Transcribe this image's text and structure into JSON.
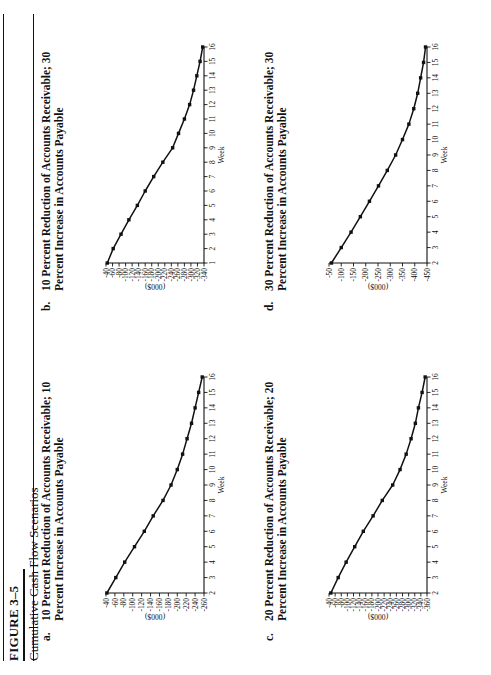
{
  "figure": {
    "number": "FIGURE 3–5",
    "title": "Cumulative Cash Flow Scenarios"
  },
  "axis_names": {
    "x": "Week",
    "y_units": "(000$)"
  },
  "panels": [
    {
      "letter": "a.",
      "title": "10 Percent Reduction of Accounts Receivable; 10 Percent Increase in Accounts Payable"
    },
    {
      "letter": "b.",
      "title": "10 Percent Reduction of Accounts Receivable; 30 Percent Increase in Accounts Payable"
    },
    {
      "letter": "c.",
      "title": "20 Percent Reduction of Accounts Receivable; 20 Percent Increase in Accounts Payable"
    },
    {
      "letter": "d.",
      "title": "30 Percent Reduction of Accounts Receivable; 30 Percent Increase in Accounts Payable"
    }
  ],
  "chart_data": [
    {
      "type": "line",
      "title": "10 Percent Reduction of Accounts Receivable; 10 Percent Increase in Accounts Payable",
      "panel": "a",
      "xlabel": "Week",
      "ylabel": "(000$)",
      "x": [
        2,
        3,
        4,
        5,
        6,
        7,
        8,
        9,
        10,
        11,
        12,
        13,
        14,
        15,
        16
      ],
      "xticklabels": [
        "2",
        "3",
        "4",
        "5",
        "6",
        "7",
        "8",
        "9",
        "10",
        "11",
        "12",
        "13",
        "14",
        "15",
        "16"
      ],
      "xlim": [
        2,
        16
      ],
      "yticklabels": [
        "-40",
        "-60",
        "-80",
        "-100",
        "-120",
        "-140",
        "-160",
        "-180",
        "-200",
        "-220",
        "-240",
        "-260"
      ],
      "ylim": [
        -260,
        -40
      ],
      "grid": false,
      "legend": "none",
      "markers": true,
      "series": [
        {
          "name": "Cumulative cash flow",
          "values": [
            -42,
            -62,
            -82,
            -104,
            -126,
            -146,
            -168,
            -186,
            -200,
            -212,
            -222,
            -232,
            -240,
            -248,
            -256
          ]
        }
      ]
    },
    {
      "type": "line",
      "title": "10 Percent Reduction of Accounts Receivable; 30 Percent Increase in Accounts Payable",
      "panel": "b",
      "xlabel": "Week",
      "ylabel": "(000$)",
      "x": [
        1,
        2,
        3,
        4,
        5,
        6,
        7,
        8,
        9,
        10,
        11,
        12,
        13,
        14,
        15,
        16
      ],
      "xticklabels": [
        "1",
        "2",
        "3",
        "4",
        "5",
        "6",
        "7",
        "8",
        "9",
        "10",
        "11",
        "12",
        "13",
        "14",
        "15",
        "16"
      ],
      "xlim": [
        1,
        16
      ],
      "yticklabels": [
        "-40",
        "-60",
        "-80",
        "-100",
        "-120",
        "-140",
        "-160",
        "-180",
        "-200",
        "-220",
        "-240",
        "-260",
        "-280",
        "-300",
        "-320",
        "-340"
      ],
      "ylim": [
        -340,
        -40
      ],
      "grid": false,
      "legend": "none",
      "markers": true,
      "series": [
        {
          "name": "Cumulative cash flow",
          "values": [
            -44,
            -62,
            -86,
            -110,
            -136,
            -160,
            -186,
            -214,
            -244,
            -262,
            -280,
            -296,
            -308,
            -318,
            -328,
            -336
          ]
        }
      ]
    },
    {
      "type": "line",
      "title": "20 Percent Reduction of Accounts Receivable; 20 Percent Increase in Accounts Payable",
      "panel": "c",
      "xlabel": "Week",
      "ylabel": "(000$)",
      "x": [
        2,
        3,
        4,
        5,
        6,
        7,
        8,
        9,
        10,
        11,
        12,
        13,
        14,
        15,
        16
      ],
      "xticklabels": [
        "2",
        "3",
        "4",
        "5",
        "6",
        "7",
        "8",
        "9",
        "10",
        "11",
        "12",
        "13",
        "14",
        "15",
        "16"
      ],
      "xlim": [
        2,
        16
      ],
      "yticklabels": [
        "-40",
        "-60",
        "-80",
        "-100",
        "-120",
        "-140",
        "-160",
        "-180",
        "-200",
        "-220",
        "-240",
        "-260",
        "-280",
        "-300",
        "-320",
        "-340",
        "-360"
      ],
      "ylim": [
        -360,
        -40
      ],
      "grid": false,
      "legend": "none",
      "markers": true,
      "series": [
        {
          "name": "Cumulative cash flow",
          "values": [
            -46,
            -70,
            -96,
            -124,
            -152,
            -184,
            -214,
            -248,
            -272,
            -292,
            -308,
            -322,
            -332,
            -344,
            -354
          ]
        }
      ]
    },
    {
      "type": "line",
      "title": "30 Percent Reduction of Accounts Receivable; 30 Percent Increase in Accounts Payable",
      "panel": "d",
      "xlabel": "Week",
      "ylabel": "(000$)",
      "x": [
        2,
        3,
        4,
        5,
        6,
        7,
        8,
        9,
        10,
        11,
        12,
        13,
        14,
        15,
        16
      ],
      "xticklabels": [
        "2",
        "3",
        "4",
        "5",
        "6",
        "7",
        "8",
        "9",
        "10",
        "11",
        "12",
        "13",
        "14",
        "15",
        "16"
      ],
      "xlim": [
        -450,
        -50
      ],
      "yticklabels": [
        "-50",
        "-100",
        "-150",
        "-200",
        "-250",
        "-300",
        "-350",
        "-400",
        "-450"
      ],
      "ylim": [
        -450,
        -50
      ],
      "grid": false,
      "legend": "none",
      "markers": true,
      "series": [
        {
          "name": "Cumulative cash flow",
          "values": [
            -60,
            -100,
            -140,
            -178,
            -215,
            -252,
            -288,
            -322,
            -350,
            -376,
            -396,
            -412,
            -424,
            -436,
            -444
          ]
        }
      ]
    }
  ]
}
